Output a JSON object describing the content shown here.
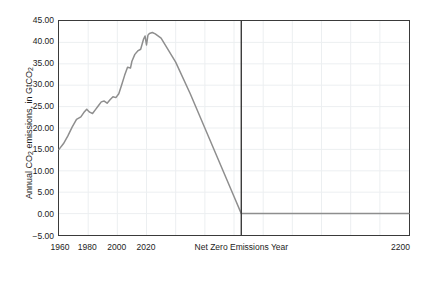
{
  "chart_data": {
    "type": "line",
    "title": "",
    "xlabel": "",
    "ylabel": "Annual CO2 emissions, in GtCO2",
    "ylabel_parts": {
      "prefix": "Annual CO",
      "sub1": "2",
      "middle": " emissions, in GtCO",
      "sub2": "2"
    },
    "xlim": [
      1960,
      2200
    ],
    "ylim": [
      -5,
      45
    ],
    "grid": true,
    "legend": false,
    "y_ticks": [
      "45.00",
      "40.00",
      "35.00",
      "30.00",
      "25.00",
      "20.00",
      "15.00",
      "10.00",
      "5.00",
      "0.00",
      "-5.00"
    ],
    "y_tick_values": [
      45,
      40,
      35,
      30,
      25,
      20,
      15,
      10,
      5,
      0,
      -5
    ],
    "x_ticks": [
      "1960",
      "1980",
      "2000",
      "2020",
      "2200"
    ],
    "x_tick_values": [
      1960,
      1980,
      2000,
      2020,
      2200
    ],
    "annotations": [
      {
        "name": "net-zero-marker",
        "label": "Net Zero Emissions Year",
        "x": 2085,
        "type": "vline"
      }
    ],
    "series": [
      {
        "name": "Annual CO2 emissions",
        "color": "#8e8e8e",
        "x": [
          1960,
          1963,
          1966,
          1969,
          1972,
          1975,
          1977,
          1979,
          1981,
          1983,
          1985,
          1987,
          1989,
          1991,
          1993,
          1995,
          1997,
          1999,
          2001,
          2003,
          2005,
          2007,
          2009,
          2010,
          2012,
          2014,
          2016,
          2018,
          2019,
          2020,
          2021,
          2022,
          2024,
          2026,
          2030,
          2040,
          2050,
          2060,
          2070,
          2080,
          2085,
          2100,
          2120,
          2150,
          2180,
          2200
        ],
        "y": [
          15.0,
          16.3,
          18.1,
          20.2,
          22.0,
          22.6,
          23.6,
          24.4,
          23.7,
          23.4,
          24.3,
          25.2,
          26.1,
          26.3,
          25.8,
          26.6,
          27.3,
          27.1,
          28.0,
          30.1,
          32.3,
          34.2,
          34.0,
          35.6,
          37.2,
          38.0,
          38.4,
          40.8,
          41.5,
          39.4,
          41.7,
          42.1,
          42.3,
          42.0,
          41.0,
          35.4,
          28.0,
          20.0,
          12.0,
          4.0,
          0.0,
          0.0,
          0.0,
          0.0,
          0.0,
          0.0
        ]
      }
    ]
  },
  "colors": {
    "series": "#8e8e8e",
    "axis": "#3a3a3a",
    "grid": "#eceff1",
    "text": "#1c1c1c",
    "background": "#ffffff"
  }
}
